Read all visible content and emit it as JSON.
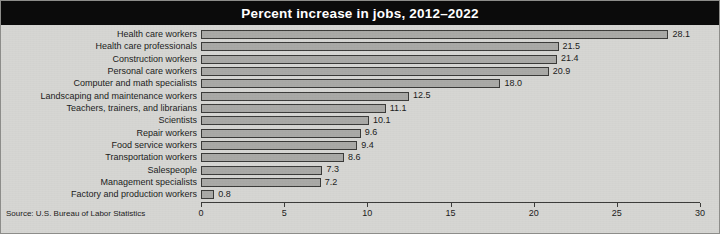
{
  "chart_data": {
    "type": "bar",
    "orientation": "horizontal",
    "title": "Percent increase in jobs, 2012–2022",
    "xlabel": "",
    "ylabel": "",
    "xlim": [
      0,
      30
    ],
    "xticks": [
      0,
      5,
      10,
      15,
      20,
      25,
      30
    ],
    "xtick_labels": [
      "0",
      "5",
      "10",
      "15",
      "20",
      "25",
      "30"
    ],
    "grid": false,
    "legend": null,
    "source": "Source: U.S. Bureau of Labor Statistics",
    "categories": [
      "Health care workers",
      "Health care professionals",
      "Construction workers",
      "Personal care workers",
      "Computer and math specialists",
      "Landscaping and maintenance workers",
      "Teachers, trainers, and librarians",
      "Scientists",
      "Repair workers",
      "Food service workers",
      "Transportation workers",
      "Salespeople",
      "Management specialists",
      "Factory and production workers"
    ],
    "values": [
      28.1,
      21.5,
      21.4,
      20.9,
      18.0,
      12.5,
      11.1,
      10.1,
      9.6,
      9.4,
      8.6,
      7.3,
      7.2,
      0.8
    ],
    "value_labels": [
      "28.1",
      "21.5",
      "21.4",
      "20.9",
      "18.0",
      "12.5",
      "11.1",
      "10.1",
      "9.6",
      "9.4",
      "8.6",
      "7.3",
      "7.2",
      "0.8"
    ],
    "colors": {
      "bar_fill": "#a9a9a6",
      "bar_edge": "#3a3a38",
      "background": "#d6d6d3",
      "title_band": "#0b0b0b",
      "title_text": "#ffffff",
      "text": "#1a1a1a"
    }
  }
}
